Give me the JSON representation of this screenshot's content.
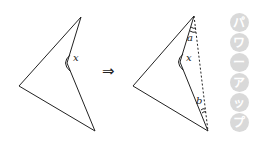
{
  "diagram": {
    "left_figure": {
      "shape": "concave quadrilateral",
      "vertices": {
        "top": [
          81,
          17
        ],
        "reflex": [
          67,
          63
        ],
        "left": [
          19,
          86
        ],
        "bottom": [
          95,
          131
        ]
      },
      "angle_label": "x"
    },
    "transition_symbol": "⇒",
    "right_figure": {
      "shape": "concave quadrilateral with auxiliary dashed segment",
      "vertices": {
        "top": [
          194,
          16
        ],
        "reflex": [
          180,
          62
        ],
        "left": [
          133,
          86
        ],
        "bottom": [
          208,
          131
        ]
      },
      "angle_labels": {
        "reflex": "x",
        "top": "a",
        "bottom": "b"
      },
      "auxiliary_line": "dashed, top to bottom"
    },
    "side_tag": {
      "text": "パワーアップ",
      "chars": [
        "パ",
        "ワ",
        "ー",
        "ア",
        "ッ",
        "プ"
      ],
      "color": "#d9d9d9"
    },
    "colors": {
      "line": "#222222",
      "background": "#ffffff"
    }
  }
}
